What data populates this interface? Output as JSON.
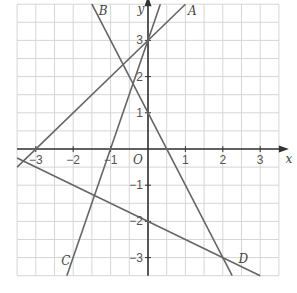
{
  "chart_data": {
    "type": "line",
    "title": "",
    "xlabel": "x",
    "ylabel": "y",
    "origin_label": "O",
    "xlim": [
      -3.5,
      3.5
    ],
    "ylim": [
      -3.5,
      4
    ],
    "grid": true,
    "grid_step": 0.5,
    "x_ticks": [
      "-3",
      "-2",
      "-1",
      "1",
      "2",
      "3"
    ],
    "y_ticks": [
      "3",
      "2",
      "1",
      "-1",
      "-2",
      "-3"
    ],
    "series": [
      {
        "name": "A",
        "equation": "y = x + 3",
        "points": [
          [
            -3.5,
            -0.5
          ],
          [
            1,
            4
          ]
        ]
      },
      {
        "name": "B",
        "equation": "y = -2x + 1",
        "points": [
          [
            -1.5,
            4
          ],
          [
            2.25,
            -3.5
          ]
        ]
      },
      {
        "name": "C",
        "equation": "y = 3x + 3",
        "points": [
          [
            -2.17,
            -3.5
          ],
          [
            0.33,
            4
          ]
        ]
      },
      {
        "name": "D",
        "equation": "y = -0.5x - 2",
        "points": [
          [
            -3.5,
            -0.25
          ],
          [
            3,
            -3.5
          ]
        ]
      }
    ]
  }
}
